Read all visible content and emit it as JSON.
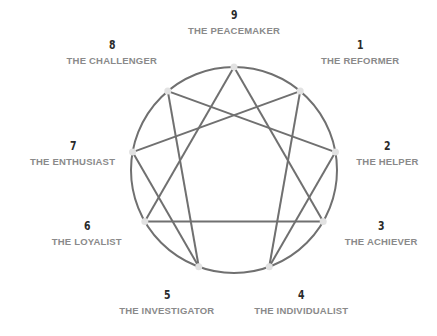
{
  "colors": {
    "line": "#707070",
    "node": "#e2e2e2",
    "number": "#2a2a2a",
    "label": "#8a8a8a",
    "background": "#ffffff"
  },
  "types": [
    {
      "number": "1",
      "name": "THE REFORMER"
    },
    {
      "number": "2",
      "name": "THE HELPER"
    },
    {
      "number": "3",
      "name": "THE ACHIEVER"
    },
    {
      "number": "4",
      "name": "THE INDIVIDUALIST"
    },
    {
      "number": "5",
      "name": "THE INVESTIGATOR"
    },
    {
      "number": "6",
      "name": "THE LOYALIST"
    },
    {
      "number": "7",
      "name": "THE ENTHUSIAST"
    },
    {
      "number": "8",
      "name": "THE CHALLENGER"
    },
    {
      "number": "9",
      "name": "THE PEACEMAKER"
    }
  ],
  "connections": {
    "triangle": [
      3,
      6,
      9
    ],
    "hexad": [
      1,
      4,
      2,
      8,
      5,
      7
    ]
  }
}
